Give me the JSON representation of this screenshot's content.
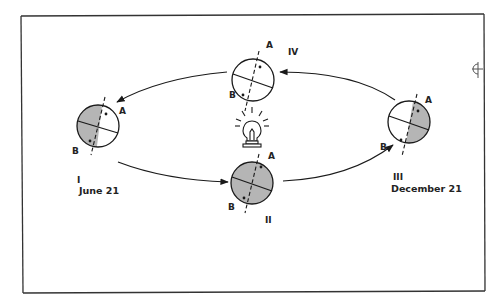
{
  "figure": {
    "colors": {
      "line": "#1a1a1a",
      "shade": "#b5b5b5",
      "background": "#ffffff",
      "frame": "#333333"
    }
  },
  "positions": [
    {
      "id": "I",
      "numeral": "I",
      "date": "June 21",
      "point_a": "A",
      "point_b": "B",
      "shading": "left-half"
    },
    {
      "id": "II",
      "numeral": "II",
      "date": "",
      "point_a": "A",
      "point_b": "B",
      "shading": "full"
    },
    {
      "id": "III",
      "numeral": "III",
      "date": "December 21",
      "point_a": "A",
      "point_b": "B",
      "shading": "right-half"
    },
    {
      "id": "IV",
      "numeral": "IV",
      "date": "",
      "point_a": "A",
      "point_b": "B",
      "shading": "none"
    }
  ],
  "light_source": {
    "icon": "light-bulb-icon"
  },
  "arrows": [
    "IV-to-I",
    "I-to-II",
    "II-to-III",
    "III-to-IV"
  ],
  "margin_mark": {
    "icon": "crosshair-half-circle-icon"
  }
}
